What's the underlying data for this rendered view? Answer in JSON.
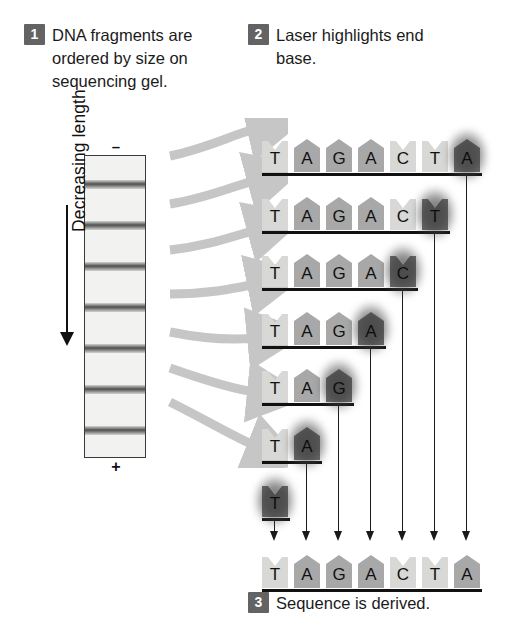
{
  "steps": [
    {
      "num": "1",
      "text": "DNA fragments are ordered by size on sequencing gel."
    },
    {
      "num": "2",
      "text": "Laser highlights end base."
    },
    {
      "num": "3",
      "text": "Sequence is derived."
    }
  ],
  "gel": {
    "top_electrode": "–",
    "bottom_electrode": "+",
    "axis_label": "Decreasing length",
    "band_count": 7,
    "band_color": "#4a4a4a",
    "gel_fill": "#f2f2f0"
  },
  "fragments": [
    {
      "sequence": [
        "T",
        "A",
        "G",
        "A",
        "C",
        "T",
        "A"
      ],
      "terminal_base": "A"
    },
    {
      "sequence": [
        "T",
        "A",
        "G",
        "A",
        "C",
        "T"
      ],
      "terminal_base": "T"
    },
    {
      "sequence": [
        "T",
        "A",
        "G",
        "A",
        "C"
      ],
      "terminal_base": "C"
    },
    {
      "sequence": [
        "T",
        "A",
        "G",
        "A"
      ],
      "terminal_base": "A"
    },
    {
      "sequence": [
        "T",
        "A",
        "G"
      ],
      "terminal_base": "G"
    },
    {
      "sequence": [
        "T",
        "A"
      ],
      "terminal_base": "A"
    },
    {
      "sequence": [
        "T"
      ],
      "terminal_base": "T"
    }
  ],
  "derived_sequence": [
    "T",
    "A",
    "G",
    "A",
    "C",
    "T",
    "A"
  ],
  "colors": {
    "badge": "#636363",
    "purine_base": "#a8a8a8",
    "pyrimidine_base": "#d8d8d6",
    "highlight": "#6b6b6b",
    "arrow_gray": "#c3c3c3",
    "text": "#1b1b1b"
  }
}
